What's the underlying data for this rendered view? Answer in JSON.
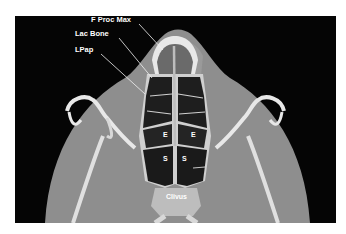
{
  "figure": {
    "modality": "CT axial bone window",
    "annotations": [
      {
        "id": "f-proc-max",
        "text": "F Proc Max",
        "x": 91,
        "y": 16
      },
      {
        "id": "lac-bone",
        "text": "Lac Bone",
        "x": 75,
        "y": 30
      },
      {
        "id": "lpap",
        "text": "LPap",
        "x": 75,
        "y": 46
      }
    ],
    "region_labels": [
      {
        "id": "ethmoid-left",
        "text": "E",
        "x": 163,
        "y": 131
      },
      {
        "id": "ethmoid-right",
        "text": "E",
        "x": 191,
        "y": 131
      },
      {
        "id": "sphenoid-left",
        "text": "S",
        "x": 163,
        "y": 155
      },
      {
        "id": "sphenoid-right",
        "text": "S",
        "x": 182,
        "y": 155
      },
      {
        "id": "clivus",
        "text": "Clivus",
        "x": 166,
        "y": 193
      }
    ],
    "colors": {
      "background": "#050505",
      "soft_tissue": "#8e8e8e",
      "bone": "#e8e8e8",
      "air": "#1a1a1a",
      "label": "#ffffff"
    }
  }
}
